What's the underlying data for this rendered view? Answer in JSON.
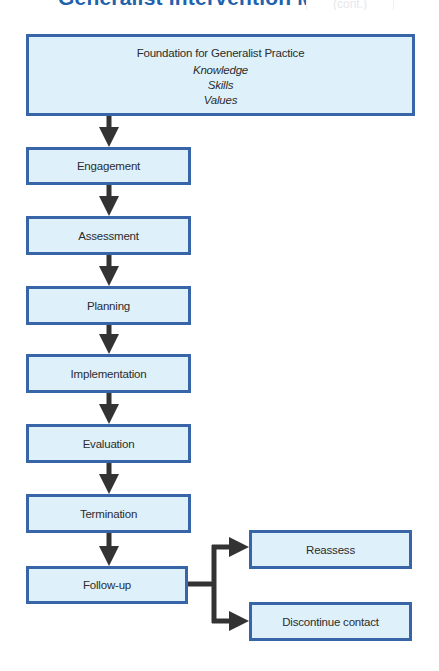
{
  "header": {
    "title": "Generalist Intervention Mo",
    "tag": "(cont.)"
  },
  "colors": {
    "title": "#1f63ad",
    "box_fill": "#def1fb",
    "box_border": "#3864a8",
    "arrow": "#333333",
    "text": "#2c2c2c"
  },
  "foundation": {
    "heading": "Foundation for Generalist Practice",
    "items": [
      "Knowledge",
      "Skills",
      "Values"
    ]
  },
  "steps": [
    {
      "label": "Engagement"
    },
    {
      "label": "Assessment"
    },
    {
      "label": "Planning"
    },
    {
      "label": "Implementation"
    },
    {
      "label": "Evaluation"
    },
    {
      "label": "Termination"
    },
    {
      "label": "Follow-up"
    }
  ],
  "branches": [
    {
      "label": "Reassess"
    },
    {
      "label": "Discontinue contact"
    }
  ]
}
